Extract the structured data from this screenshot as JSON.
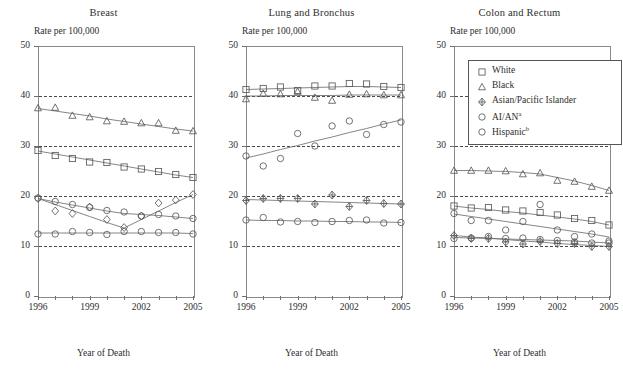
{
  "figure": {
    "x_axis_title": "Year of Death",
    "y_axis_caption": "Rate per 100,000",
    "y_ticks": [
      "0",
      "10",
      "20",
      "30",
      "40",
      "50"
    ],
    "x_ticks": [
      "1996",
      "1999",
      "2002",
      "2005"
    ],
    "legend": {
      "items": [
        {
          "label": "White",
          "marker": "square-marker"
        },
        {
          "label": "Black",
          "marker": "triangle-marker"
        },
        {
          "label": "Asian/Pacific Islander",
          "marker": "diamond-cross-marker"
        },
        {
          "label": "AI/AN",
          "marker": "small-circle-marker",
          "footnote": "a"
        },
        {
          "label": "Hispanic",
          "marker": "circle-marker",
          "footnote": "b"
        }
      ]
    }
  },
  "chart_data": [
    {
      "type": "scatter",
      "title": "Breast",
      "xlabel": "Year of Death",
      "ylabel": "Rate per 100,000",
      "ylim": [
        0,
        50
      ],
      "xlim": [
        1996,
        2005
      ],
      "yticks": [
        0,
        10,
        20,
        30,
        40,
        50
      ],
      "grid": "horizontal-dashed at 10, 20, 30, 40",
      "legend_position": "none",
      "x": [
        1996,
        1997,
        1998,
        1999,
        2000,
        2001,
        2002,
        2003,
        2004,
        2005
      ],
      "series": [
        {
          "name": "White",
          "marker": "square",
          "values": [
            29.1,
            28.1,
            27.5,
            26.8,
            26.7,
            25.8,
            25.4,
            24.9,
            24.3,
            23.7
          ],
          "trend": [
            29.0,
            28.4,
            27.8,
            27.2,
            26.6,
            26.0,
            25.4,
            24.8,
            24.2,
            23.7
          ]
        },
        {
          "name": "Black",
          "marker": "triangle",
          "values": [
            37.6,
            37.7,
            36.1,
            35.8,
            35.0,
            34.9,
            34.6,
            34.6,
            33.1,
            33.0
          ],
          "trend": [
            37.5,
            37.0,
            36.5,
            36.0,
            35.4,
            34.9,
            34.4,
            33.9,
            33.4,
            33.0
          ]
        },
        {
          "name": "Asian/Pacific Islander",
          "marker": "diamond",
          "values": [
            19.5,
            17.0,
            16.5,
            17.8,
            15.3,
            13.7,
            16.0,
            18.6,
            19.2,
            20.3
          ],
          "trend": [
            19.5,
            18.3,
            17.1,
            15.9,
            14.7,
            13.6,
            15.3,
            17.0,
            18.7,
            20.3
          ]
        },
        {
          "name": "AI/AN",
          "marker": "small-circle",
          "values": [
            19.6,
            18.9,
            18.3,
            17.7,
            17.1,
            16.8,
            16.0,
            16.3,
            16.0,
            15.5
          ],
          "trend": [
            19.5,
            18.8,
            18.2,
            17.6,
            17.0,
            16.5,
            16.3,
            16.1,
            15.8,
            15.5
          ]
        },
        {
          "name": "Hispanic",
          "marker": "circle",
          "values": [
            12.4,
            12.4,
            12.9,
            12.7,
            12.3,
            12.9,
            12.9,
            12.7,
            12.7,
            12.4
          ],
          "trend": [
            12.6,
            12.6,
            12.6,
            12.6,
            12.6,
            12.6,
            12.6,
            12.6,
            12.6,
            12.5
          ]
        }
      ]
    },
    {
      "type": "scatter",
      "title": "Lung and Bronchus",
      "xlabel": "Year of Death",
      "ylabel": "Rate per 100,000",
      "ylim": [
        0,
        50
      ],
      "xlim": [
        1996,
        2005
      ],
      "yticks": [
        0,
        10,
        20,
        30,
        40,
        50
      ],
      "grid": "horizontal-dashed at 10, 20, 30, 40",
      "legend_position": "none",
      "x": [
        1996,
        1997,
        1998,
        1999,
        2000,
        2001,
        2002,
        2003,
        2004,
        2005
      ],
      "series": [
        {
          "name": "White",
          "marker": "square",
          "values": [
            41.3,
            41.5,
            41.8,
            41.1,
            42.0,
            42.0,
            42.5,
            42.4,
            41.9,
            41.7
          ],
          "trend": [
            41.3,
            41.4,
            41.5,
            41.6,
            41.7,
            41.8,
            41.9,
            41.9,
            41.8,
            41.7
          ]
        },
        {
          "name": "Black",
          "marker": "triangle",
          "values": [
            39.4,
            40.5,
            40.4,
            40.9,
            39.7,
            39.1,
            40.3,
            40.4,
            40.2,
            40.2
          ],
          "trend": [
            40.0,
            40.0,
            40.1,
            40.1,
            40.1,
            40.1,
            40.2,
            40.2,
            40.2,
            40.2
          ]
        },
        {
          "name": "Asian/Pacific Islander",
          "marker": "diamond-cross",
          "values": [
            19.1,
            19.5,
            19.5,
            19.5,
            18.4,
            20.2,
            17.9,
            19.1,
            18.5,
            18.4
          ],
          "trend": [
            19.3,
            19.2,
            19.1,
            19.0,
            18.9,
            18.8,
            18.7,
            18.6,
            18.5,
            18.4
          ]
        },
        {
          "name": "AI/AN",
          "marker": "small-circle",
          "values": [
            28.0,
            26.0,
            27.5,
            32.5,
            30.0,
            34.0,
            35.0,
            32.3,
            34.3,
            34.8
          ],
          "trend": [
            27.6,
            28.4,
            29.3,
            30.1,
            31.0,
            31.8,
            32.7,
            33.5,
            34.4,
            35.2
          ]
        },
        {
          "name": "Hispanic",
          "marker": "circle",
          "values": [
            15.2,
            15.7,
            14.8,
            14.9,
            14.7,
            14.9,
            15.1,
            15.2,
            14.6,
            14.7
          ],
          "trend": [
            15.2,
            15.1,
            15.1,
            15.0,
            15.0,
            14.9,
            14.9,
            14.8,
            14.8,
            14.7
          ]
        }
      ]
    },
    {
      "type": "scatter",
      "title": "Colon and Rectum",
      "xlabel": "Year of Death",
      "ylabel": "Rate per 100,000",
      "ylim": [
        0,
        50
      ],
      "xlim": [
        1996,
        2005
      ],
      "yticks": [
        0,
        10,
        20,
        30,
        40,
        50
      ],
      "grid": "horizontal-dashed at 10, 20, 30, 40",
      "legend_position": "top-right-inside",
      "x": [
        1996,
        1997,
        1998,
        1999,
        2000,
        2001,
        2002,
        2003,
        2004,
        2005
      ],
      "series": [
        {
          "name": "White",
          "marker": "square",
          "values": [
            18.0,
            17.6,
            17.7,
            17.2,
            17.0,
            16.7,
            16.2,
            15.5,
            15.1,
            14.2
          ],
          "trend": [
            18.0,
            17.6,
            17.3,
            16.9,
            16.6,
            16.2,
            15.8,
            15.4,
            14.9,
            14.2
          ]
        },
        {
          "name": "Black",
          "marker": "triangle",
          "values": [
            25.1,
            25.1,
            25.1,
            25.0,
            24.4,
            24.6,
            23.1,
            22.9,
            21.9,
            21.1
          ],
          "trend": [
            25.1,
            25.1,
            25.0,
            24.9,
            24.7,
            24.4,
            23.7,
            23.0,
            22.1,
            21.1
          ]
        },
        {
          "name": "Asian/Pacific Islander",
          "marker": "diamond-cross",
          "values": [
            12.1,
            11.5,
            11.5,
            10.8,
            10.4,
            10.9,
            10.5,
            10.5,
            9.9,
            9.9
          ],
          "trend": [
            12.1,
            11.8,
            11.6,
            11.3,
            11.0,
            10.8,
            10.5,
            10.3,
            10.1,
            9.9
          ]
        },
        {
          "name": "AI/AN",
          "marker": "small-circle",
          "values": [
            16.5,
            15.1,
            15.1,
            13.2,
            14.9,
            18.3,
            13.2,
            11.9,
            12.4,
            11.0
          ],
          "trend": [
            16.4,
            15.9,
            15.4,
            14.9,
            14.4,
            13.9,
            13.4,
            12.9,
            12.4,
            11.8
          ]
        },
        {
          "name": "Hispanic",
          "marker": "circle",
          "values": [
            11.5,
            11.6,
            11.9,
            11.5,
            11.6,
            11.3,
            11.1,
            10.8,
            10.6,
            10.6
          ],
          "trend": [
            11.7,
            11.6,
            11.5,
            11.4,
            11.3,
            11.2,
            11.1,
            11.0,
            10.8,
            10.6
          ]
        }
      ]
    }
  ]
}
